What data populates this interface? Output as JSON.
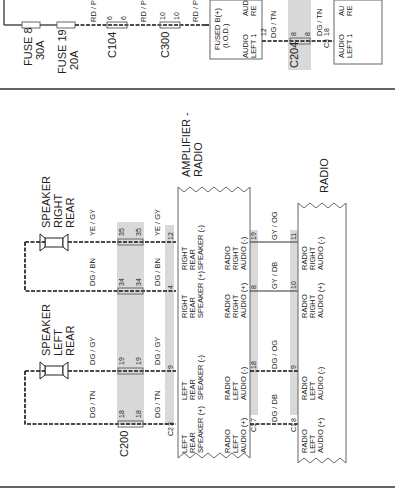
{
  "top_section": {
    "fuses": [
      {
        "name": "FUSE 8",
        "rating": "30A"
      },
      {
        "name": "FUSE 19",
        "rating": "20A"
      }
    ],
    "wire_colors": [
      "RD / PK",
      "RD / PK",
      "RD / PK"
    ],
    "connectors": [
      {
        "name": "C104",
        "pin_a": "6",
        "pin_b": "6"
      },
      {
        "name": "C300",
        "pin_a": "10",
        "pin_b": "10"
      },
      {
        "name": "C204",
        "pin_a": "8",
        "pin_b": "8"
      }
    ],
    "module_a": {
      "line1": "FUSED B(+)",
      "line2": "(I.O.D.)",
      "audio_l1": "AUDIO",
      "audio_l2": "LEFT 1",
      "audio_r1": "AUD",
      "audio_r2": "RE",
      "pin": "12",
      "wire": "DG / TN"
    },
    "module_b": {
      "audio_l1": "AUDIO",
      "audio_l2": "LEFT 1",
      "audio_r1": "AU",
      "audio_r2": "RE",
      "pin": "18",
      "conn": "C3",
      "wire": "DG / TN"
    }
  },
  "speakers": [
    {
      "line1": "SPEAKER",
      "line2": "RIGHT",
      "line3": "REAR"
    },
    {
      "line1": "SPEAKER",
      "line2": "LEFT",
      "line3": "REAR"
    }
  ],
  "circuits": [
    {
      "wire_a": "YE / GY",
      "pin_a": "35",
      "pin_b": "35",
      "wire_b": "YE / GY",
      "amp_pin": "12",
      "amp_l1": "RIGHT",
      "amp_l2": "REAR",
      "amp_l3": "SPEAKER (-)"
    },
    {
      "wire_a": "DG / BN",
      "pin_a": "34",
      "pin_b": "34",
      "wire_b": "DG / BN",
      "amp_pin": "4",
      "amp_l1": "RIGHT",
      "amp_l2": "REAR",
      "amp_l3": "SPEAKER (+)"
    },
    {
      "wire_a": "DG / GY",
      "pin_a": "19",
      "pin_b": "19",
      "wire_b": "DG / GY",
      "amp_pin": "9",
      "amp_l1": "LEFT",
      "amp_l2": "REAR",
      "amp_l3": "SPEAKER (-)"
    },
    {
      "wire_a": "DG / TN",
      "pin_a": "18",
      "pin_b": "18",
      "wire_b": "DG / TN",
      "amp_pin": "3",
      "amp_l1": "LEFT",
      "amp_l2": "REAR",
      "amp_l3": "SPEAKER (+)"
    }
  ],
  "connector_c200": "C200",
  "connector_c2": "C2",
  "amplifier": {
    "title1": "AMPLIFIER -",
    "title2": "RADIO",
    "conn_out": "C1"
  },
  "audio_circuits": [
    {
      "amp_pin": "19",
      "amp_l1": "RADIO",
      "amp_l2": "RIGHT",
      "amp_l3": "AUDIO (-)",
      "wire": "GY / OG",
      "radio_pin": "11",
      "r_l1": "RADIO",
      "r_l2": "RIGHT",
      "r_l3": "AUDIO (-)"
    },
    {
      "amp_pin": "8",
      "amp_l1": "RADIO",
      "amp_l2": "RIGHT",
      "amp_l3": "AUDIO (+)",
      "wire": "GY / DB",
      "radio_pin": "10",
      "r_l1": "RADIO",
      "r_l2": "RIGHT",
      "r_l3": "AUDIO (+)"
    },
    {
      "amp_pin": "18",
      "amp_l1": "RADIO",
      "amp_l2": "LEFT",
      "amp_l3": "AUDIO (-)",
      "wire": "DG / OG",
      "radio_pin": "9",
      "r_l1": "RADIO",
      "r_l2": "LEFT",
      "r_l3": "AUDIO (-)"
    },
    {
      "amp_pin": "7",
      "amp_l1": "RADIO",
      "amp_l2": "LEFT",
      "amp_l3": "AUDIO (+)",
      "wire": "DG / DB",
      "radio_pin": "8",
      "r_l1": "RADIO",
      "r_l2": "LEFT",
      "r_l3": "AUDIO (+)"
    }
  ],
  "radio": {
    "title": "RADIO",
    "conn": "C1"
  }
}
